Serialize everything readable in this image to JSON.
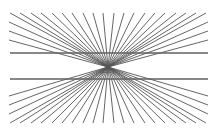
{
  "figure": {
    "type": "hering-illusion",
    "background": "#ffffff",
    "ray_color": "#555555",
    "line_color": "#606060",
    "vanishing_point": [
      108,
      67
    ],
    "frame": {
      "left": 9,
      "right": 208,
      "top": 13,
      "bottom": 123
    },
    "top_ray_x": [
      10,
      20,
      31,
      41,
      52,
      62,
      72,
      83,
      93,
      103,
      114,
      124,
      134,
      145,
      155,
      165,
      176,
      186,
      196,
      206
    ],
    "bottom_ray_x": [
      10,
      20,
      31,
      41,
      52,
      62,
      72,
      83,
      93,
      103,
      114,
      124,
      134,
      145,
      155,
      165,
      176,
      186,
      196,
      206
    ],
    "side_ray_y_top": [
      22,
      31,
      40
    ],
    "side_ray_y_bottom": [
      96,
      105,
      114
    ],
    "horizontal_lines": [
      {
        "y": 53,
        "x1": 10,
        "x2": 208
      },
      {
        "y": 79,
        "x1": 10,
        "x2": 208
      }
    ]
  }
}
